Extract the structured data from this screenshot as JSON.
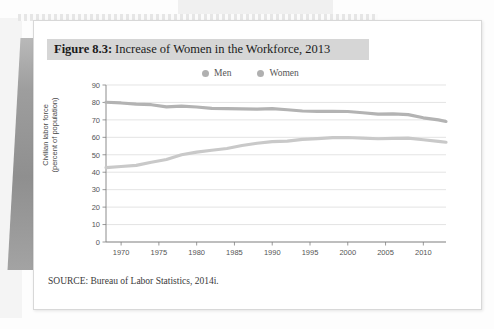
{
  "figure": {
    "label": "Figure 8.3:",
    "title": "Increase of Women in the Workforce, 2013",
    "source": "SOURCE: Bureau of Labor Statistics, 2014i."
  },
  "colors": {
    "men_line": "#b3b3b3",
    "women_line": "#c9c9c9",
    "legend_dot": "#b0b0b0",
    "title_bar": "#d6d6d6",
    "grid": "#d9d9d9",
    "axis": "#808080"
  },
  "chart_data": {
    "type": "line",
    "title": "Increase of Women in the Workforce, 2013",
    "xlabel": "",
    "ylabel": "Civilian labor force (percent of population)",
    "ylabel_line1": "Civilian labor force",
    "ylabel_line2": "(percent of population)",
    "xlim": [
      1968,
      2013
    ],
    "ylim": [
      0,
      90
    ],
    "ytick_step": 10,
    "grid": true,
    "legend_position": "top-center",
    "yticks": [
      0,
      10,
      20,
      30,
      40,
      50,
      60,
      70,
      80,
      90
    ],
    "xticks": [
      1970,
      1975,
      1980,
      1985,
      1990,
      1995,
      2000,
      2005,
      2010
    ],
    "x": [
      1968,
      1970,
      1972,
      1974,
      1976,
      1978,
      1980,
      1982,
      1984,
      1986,
      1988,
      1990,
      1992,
      1994,
      1996,
      1998,
      2000,
      2002,
      2004,
      2006,
      2008,
      2010,
      2012,
      2013
    ],
    "series": [
      {
        "name": "Men",
        "color": "#b3b3b3",
        "values": [
          80.1,
          79.7,
          79.0,
          78.7,
          77.5,
          77.9,
          77.4,
          76.6,
          76.4,
          76.3,
          76.2,
          76.4,
          75.8,
          75.1,
          74.9,
          74.9,
          74.8,
          74.1,
          73.3,
          73.5,
          73.0,
          71.2,
          70.0,
          69.1
        ]
      },
      {
        "name": "Women",
        "color": "#c9c9c9",
        "values": [
          42.6,
          43.3,
          43.9,
          45.7,
          47.3,
          50.0,
          51.5,
          52.6,
          53.6,
          55.3,
          56.6,
          57.5,
          57.8,
          58.8,
          59.3,
          59.8,
          59.9,
          59.6,
          59.2,
          59.4,
          59.5,
          58.6,
          57.7,
          57.2
        ]
      }
    ]
  }
}
